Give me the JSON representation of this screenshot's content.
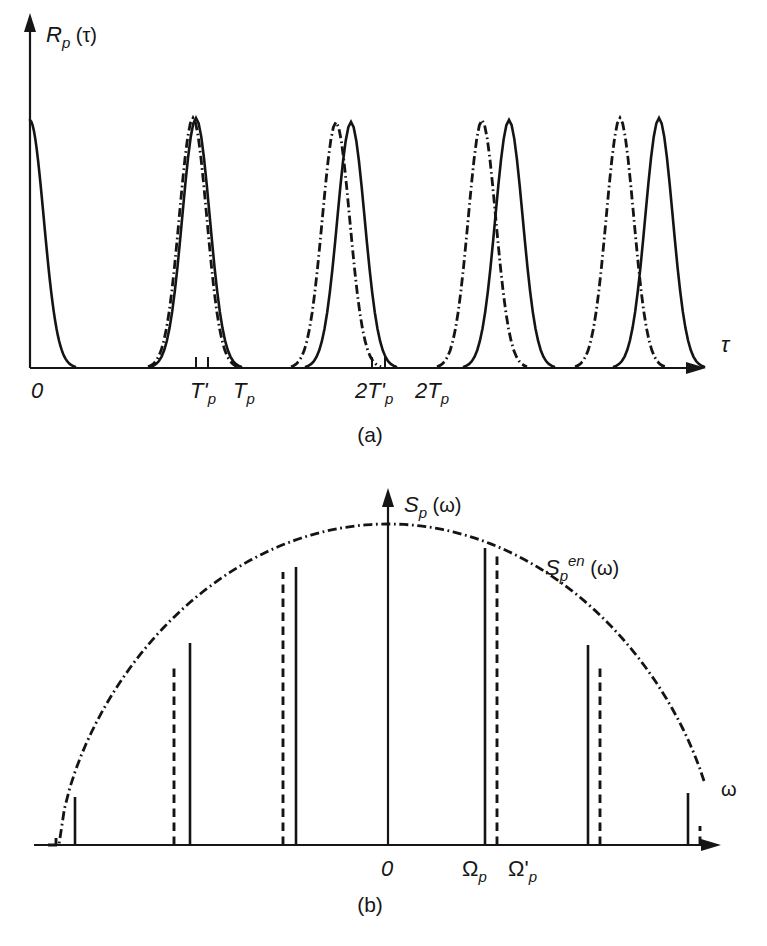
{
  "figure": {
    "background": "#ffffff",
    "ink": "#161616",
    "panels": [
      {
        "id": "panel-a",
        "caption": "(a)",
        "caption_x": 370,
        "caption_y": 442,
        "y_axis_label": {
          "base": "R",
          "sub": "p",
          "paren_open": "(",
          "arg": "τ",
          "paren_close": ")",
          "x": 46,
          "y": 42
        },
        "x_axis_label": {
          "text": "τ",
          "x": 721,
          "y": 352
        },
        "axis": {
          "x0": 30,
          "y0": 368,
          "x_end": 700,
          "y_top": 18
        },
        "tick_labels": [
          {
            "text": "0",
            "x": 31,
            "y": 398,
            "tick": false
          },
          {
            "text": "T'",
            "sub": "p",
            "x": 190,
            "y": 398,
            "tick": true,
            "tick_x": 196
          },
          {
            "text": "T",
            "sub": "p",
            "x": 233,
            "y": 398,
            "tick": true,
            "tick_x": 208
          },
          {
            "text": "2T'",
            "sub": "p",
            "x": 355,
            "y": 398,
            "tick": true,
            "tick_x": 372
          },
          {
            "text": "2T",
            "sub": "p",
            "x": 415,
            "y": 398,
            "tick": true,
            "tick_x": 385
          }
        ],
        "peaks": {
          "solid_centers": [
            30,
            196,
            351,
            509,
            659
          ],
          "dashdot_centers": [
            30,
            193,
            336,
            482,
            620
          ],
          "peak_y": [
            120,
            118,
            122,
            120,
            118
          ],
          "first_solid_half_only": true,
          "half_width": 45
        }
      },
      {
        "id": "panel-b",
        "caption": "(b)",
        "caption_x": 370,
        "caption_y": 912,
        "y_axis_label": {
          "base": "S",
          "sub": "p",
          "paren_open": "(",
          "arg": "ω",
          "paren_close": ")",
          "x": 404,
          "y": 512
        },
        "x_axis_label": {
          "text": "ω",
          "x": 721,
          "y": 796
        },
        "envelope_label": {
          "base": "S",
          "sub": "p",
          "sup": "en",
          "paren_open": "(",
          "arg": "ω",
          "paren_close": ")",
          "x": 545,
          "y": 575
        },
        "axis": {
          "x0": 34,
          "y0": 845,
          "x_end": 715,
          "center_x": 388,
          "y_top": 493
        },
        "tick_labels": [
          {
            "text": "0",
            "x": 381,
            "y": 876
          },
          {
            "text": "Ω",
            "sub": "p",
            "x": 462,
            "y": 876
          },
          {
            "text": "Ω'",
            "sub": "p",
            "x": 508,
            "y": 876
          }
        ],
        "envelope": {
          "left_x": 48,
          "right_x": 705,
          "peak_x": 388,
          "peak_y": 524,
          "baseline_y": 845
        },
        "spectral_lines": [
          {
            "kind": "dashed",
            "x": 56,
            "top_y": 838
          },
          {
            "kind": "solid",
            "x": 75,
            "top_y": 797
          },
          {
            "kind": "dashed",
            "x": 174,
            "top_y": 666
          },
          {
            "kind": "solid",
            "x": 190,
            "top_y": 643
          },
          {
            "kind": "dashed",
            "x": 283,
            "top_y": 572
          },
          {
            "kind": "solid",
            "x": 296,
            "top_y": 567
          },
          {
            "kind": "solid",
            "x": 388,
            "top_y": 527
          },
          {
            "kind": "solid",
            "x": 485,
            "top_y": 548
          },
          {
            "kind": "dashed",
            "x": 497,
            "top_y": 556
          },
          {
            "kind": "solid",
            "x": 588,
            "top_y": 645
          },
          {
            "kind": "dashed",
            "x": 600,
            "top_y": 663
          },
          {
            "kind": "solid",
            "x": 688,
            "top_y": 793
          },
          {
            "kind": "dashed",
            "x": 700,
            "top_y": 826
          }
        ]
      }
    ]
  },
  "chart_data": {
    "type": "line",
    "title": "",
    "subplots": [
      {
        "label": "(a)",
        "type": "line",
        "title": "",
        "xlabel": "τ",
        "ylabel": "R_p(τ)",
        "grid": false,
        "legend": null,
        "xtick_labels": [
          "0",
          "T'_p",
          "T_p",
          "2T'_p",
          "2T_p"
        ],
        "description": "Periodic autocorrelation: train of correlation peaks. Solid curve has period T_p, dash-dot curve has slightly shorter period T'_p, so the two peak trains drift apart with increasing lag.",
        "series": [
          {
            "name": "solid (period T_p)",
            "style": "solid",
            "peak_positions_tau": [
              0,
              1,
              2,
              3,
              4
            ],
            "peak_unit": "T_p",
            "peak_values": [
              1.0,
              1.0,
              1.0,
              1.0,
              1.0
            ]
          },
          {
            "name": "dash-dot (period T'_p)",
            "style": "dash-dot",
            "peak_positions_tau": [
              0,
              0.98,
              1.96,
              2.94,
              3.92
            ],
            "peak_unit": "T_p",
            "peak_values": [
              1.0,
              1.0,
              1.0,
              1.0,
              1.0
            ]
          }
        ],
        "ylim": [
          0,
          1.1
        ],
        "xlim": [
          0,
          4.3
        ]
      },
      {
        "label": "(b)",
        "type": "bar",
        "title": "",
        "xlabel": "ω",
        "ylabel": "S_p(ω)",
        "grid": false,
        "annotations": [
          "S_p^{en}(ω)"
        ],
        "xtick_labels": [
          "0",
          "Ω_p",
          "Ω'_p"
        ],
        "description": "Line spectrum of a pulse train: discrete harmonic lines at multiples of Ω_p (solid) and Ω'_p (dashed), bounded by the dash-dot spectral envelope S_p^{en}(ω).",
        "categories": [
          "-4",
          "-3",
          "-2",
          "-1",
          "0",
          "1",
          "2",
          "3",
          "4"
        ],
        "series": [
          {
            "name": "solid lines (spacing Ω_p)",
            "style": "solid",
            "harmonic_index": [
              -4,
              -3,
              -2,
              -1,
              0,
              1,
              2,
              3,
              4
            ],
            "values": [
              0.15,
              0.63,
              0.865,
              0.99,
              1.0,
              0.925,
              0.63,
              0.16,
              0.0
            ]
          },
          {
            "name": "dashed lines (spacing Ω'_p)",
            "style": "dashed",
            "harmonic_index": [
              -4,
              -3,
              -2,
              -1,
              0,
              1,
              2,
              3,
              4
            ],
            "values": [
              0.03,
              0.565,
              0.85,
              0.965,
              1.0,
              0.96,
              0.575,
              0.06,
              0.0
            ]
          },
          {
            "name": "envelope S_p^{en}(ω)",
            "style": "dash-dot",
            "values": [
              0.0,
              0.6,
              0.88,
              0.99,
              1.0,
              0.99,
              0.88,
              0.6,
              0.0
            ]
          }
        ],
        "ylim": [
          0,
          1.05
        ]
      }
    ]
  }
}
